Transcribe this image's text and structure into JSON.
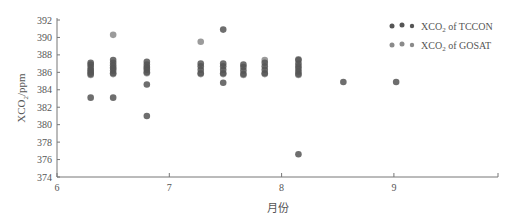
{
  "chart_data": {
    "type": "scatter",
    "title": "",
    "xlabel": "月份",
    "ylabel": "XCO₂/ppm",
    "ylabel_parts": {
      "main": "XCO",
      "sub": "2",
      "tail": "/ppm"
    },
    "xlim": [
      6,
      9.95
    ],
    "ylim": [
      374,
      392
    ],
    "x_ticks": [
      6,
      7,
      8,
      9
    ],
    "y_ticks": [
      374,
      376,
      378,
      380,
      382,
      384,
      386,
      388,
      390,
      392
    ],
    "grid": false,
    "legend_position": "top-right",
    "series": [
      {
        "name": "XCO2 of TCCON",
        "legend_label": {
          "main": "XCO",
          "sub": "2",
          "tail": " of TCCON"
        },
        "color": "#555555",
        "points": [
          [
            6.3,
            385.8
          ],
          [
            6.3,
            386.0
          ],
          [
            6.3,
            386.3
          ],
          [
            6.3,
            386.6
          ],
          [
            6.3,
            386.9
          ],
          [
            6.3,
            387.1
          ],
          [
            6.3,
            383.1
          ],
          [
            6.5,
            385.9
          ],
          [
            6.5,
            386.2
          ],
          [
            6.5,
            386.5
          ],
          [
            6.5,
            386.8
          ],
          [
            6.5,
            387.1
          ],
          [
            6.5,
            387.4
          ],
          [
            6.5,
            383.1
          ],
          [
            6.8,
            386.0
          ],
          [
            6.8,
            386.3
          ],
          [
            6.8,
            386.6
          ],
          [
            6.8,
            386.9
          ],
          [
            6.8,
            387.2
          ],
          [
            6.8,
            384.6
          ],
          [
            6.8,
            381.0
          ],
          [
            7.28,
            385.9
          ],
          [
            7.28,
            386.3
          ],
          [
            7.28,
            386.7
          ],
          [
            7.28,
            387.0
          ],
          [
            7.48,
            385.9
          ],
          [
            7.48,
            386.3
          ],
          [
            7.48,
            386.7
          ],
          [
            7.48,
            387.0
          ],
          [
            7.48,
            390.9
          ],
          [
            7.48,
            384.8
          ],
          [
            7.66,
            385.8
          ],
          [
            7.66,
            386.2
          ],
          [
            7.66,
            386.6
          ],
          [
            7.66,
            386.9
          ],
          [
            7.85,
            385.9
          ],
          [
            7.85,
            386.3
          ],
          [
            7.85,
            386.7
          ],
          [
            7.85,
            387.1
          ],
          [
            8.15,
            385.8
          ],
          [
            8.15,
            386.1
          ],
          [
            8.15,
            386.4
          ],
          [
            8.15,
            386.7
          ],
          [
            8.15,
            387.0
          ],
          [
            8.15,
            387.4
          ],
          [
            8.15,
            376.6
          ],
          [
            8.55,
            384.9
          ],
          [
            9.02,
            384.9
          ]
        ]
      },
      {
        "name": "XCO2 of GOSAT",
        "legend_label": {
          "main": "XCO",
          "sub": "2",
          "tail": " of GOSAT"
        },
        "color": "#8a8a8a",
        "points": [
          [
            6.3,
            385.7
          ],
          [
            6.3,
            386.2
          ],
          [
            6.5,
            385.8
          ],
          [
            6.5,
            386.5
          ],
          [
            6.5,
            390.3
          ],
          [
            6.8,
            385.9
          ],
          [
            6.8,
            386.5
          ],
          [
            7.28,
            385.8
          ],
          [
            7.28,
            389.5
          ],
          [
            7.48,
            385.8
          ],
          [
            7.66,
            385.7
          ],
          [
            7.85,
            385.8
          ],
          [
            7.85,
            387.4
          ],
          [
            8.15,
            385.7
          ],
          [
            8.15,
            387.5
          ]
        ]
      }
    ]
  }
}
